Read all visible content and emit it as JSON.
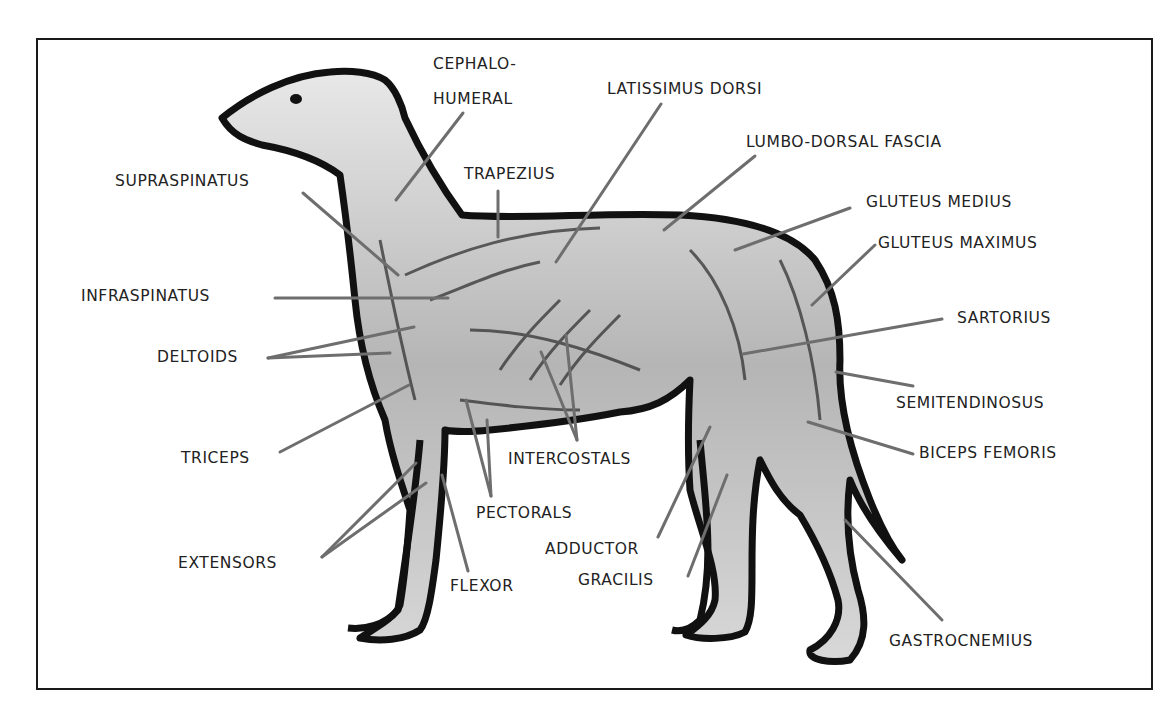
{
  "diagram": {
    "labels": {
      "cephalo_1": "CEPHALO-",
      "cephalo_2": "HUMERAL",
      "latissimus": "LATISSIMUS DORSI",
      "lumbo": "LUMBO-DORSAL FASCIA",
      "trapezius": "TRAPEZIUS",
      "supraspinatus": "SUPRASPINATUS",
      "gluteus_medius": "GLUTEUS MEDIUS",
      "gluteus_maximus": "GLUTEUS MAXIMUS",
      "infraspinatus": "INFRASPINATUS",
      "sartorius": "SARTORIUS",
      "deltoids": "DELTOIDS",
      "semitendinosus": "SEMITENDINOSUS",
      "triceps": "TRICEPS",
      "intercostals": "INTERCOSTALS",
      "biceps_femoris": "BICEPS FEMORIS",
      "pectorals": "PECTORALS",
      "adductor": "ADDUCTOR",
      "extensors": "EXTENSORS",
      "gracilis": "GRACILIS",
      "flexor": "FLEXOR",
      "gastrocnemius": "GASTROCNEMIUS"
    },
    "colors": {
      "leader_line": "#6e6e6e",
      "outline": "#111111",
      "muscle_fill": "#c9c9c9",
      "text": "#222222"
    }
  }
}
